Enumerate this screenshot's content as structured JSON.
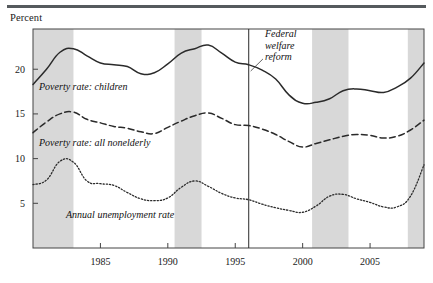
{
  "figure": {
    "y_axis_title": "Percent",
    "has_top_rule": true
  },
  "chart_data": {
    "type": "line",
    "title": "",
    "subtitle": "",
    "xlabel": "",
    "ylabel": "Percent",
    "xlim": [
      1980,
      2009
    ],
    "ylim": [
      0,
      24.5
    ],
    "grid": false,
    "legend_position": "inline-labels",
    "x_ticks": [
      1985,
      1990,
      1995,
      2000,
      2005
    ],
    "x_tick_labels": [
      "1985",
      "1990",
      "1995",
      "2000",
      "2005"
    ],
    "y_ticks": [
      5,
      10,
      15,
      20
    ],
    "y_tick_labels": [
      "5",
      "10",
      "15",
      "20"
    ],
    "x": [
      1980,
      1981,
      1982,
      1983,
      1984,
      1985,
      1986,
      1987,
      1988,
      1989,
      1990,
      1991,
      1992,
      1993,
      1994,
      1995,
      1996,
      1997,
      1998,
      1999,
      2000,
      2001,
      2002,
      2003,
      2004,
      2005,
      2006,
      2007,
      2008,
      2009
    ],
    "series": [
      {
        "name": "Poverty rate: children",
        "style": "solid",
        "label_text": "Poverty rate: children",
        "values": [
          18.3,
          20.0,
          21.9,
          22.3,
          21.5,
          20.7,
          20.5,
          20.3,
          19.5,
          19.6,
          20.6,
          21.8,
          22.3,
          22.7,
          21.8,
          20.8,
          20.5,
          19.9,
          18.9,
          17.1,
          16.2,
          16.3,
          16.7,
          17.6,
          17.8,
          17.6,
          17.4,
          18.0,
          19.0,
          20.7
        ]
      },
      {
        "name": "Poverty rate: all nonelderly",
        "style": "dashed",
        "label_text": "Poverty rate: all nonelderly",
        "values": [
          12.9,
          14.1,
          15.0,
          15.2,
          14.4,
          14.0,
          13.6,
          13.4,
          13.0,
          12.8,
          13.5,
          14.2,
          14.8,
          15.1,
          14.5,
          13.8,
          13.7,
          13.3,
          12.7,
          11.9,
          11.3,
          11.7,
          12.1,
          12.5,
          12.7,
          12.6,
          12.3,
          12.5,
          13.2,
          14.3
        ]
      },
      {
        "name": "Annual unemployment rate",
        "style": "dotted",
        "label_text": "Annual unemployment rate",
        "values": [
          7.1,
          7.6,
          9.7,
          9.6,
          7.5,
          7.2,
          7.0,
          6.2,
          5.5,
          5.3,
          5.6,
          6.8,
          7.5,
          6.9,
          6.1,
          5.6,
          5.4,
          4.9,
          4.5,
          4.2,
          4.0,
          4.7,
          5.8,
          6.0,
          5.5,
          5.1,
          4.6,
          4.6,
          5.8,
          9.3
        ]
      }
    ],
    "shaded_bands": [
      {
        "name": "recession-band-1",
        "x0": 1980.0,
        "x1": 1983.0
      },
      {
        "name": "recession-band-2",
        "x0": 1990.5,
        "x1": 1992.5
      },
      {
        "name": "recession-band-3",
        "x0": 2000.7,
        "x1": 2003.4
      },
      {
        "name": "recession-band-4",
        "x0": 2007.8,
        "x1": 2009.0
      }
    ],
    "annotations": [
      {
        "name": "federal-welfare-reform",
        "lines": [
          "Federal",
          "welfare",
          "reform"
        ],
        "vline_x": 1996,
        "text_x": 1997.2,
        "text_y_top": 23.6
      }
    ],
    "band_color": "#d8d8d8",
    "line_color": "#2a2a2a",
    "axis_color": "#444444"
  }
}
